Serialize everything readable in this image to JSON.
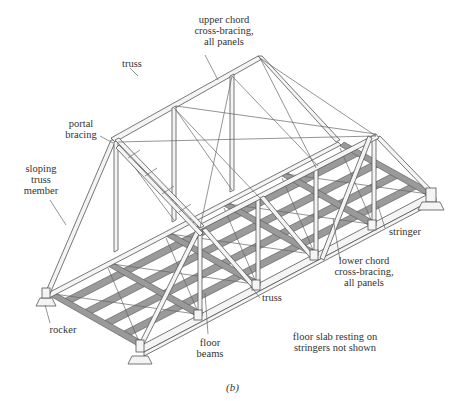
{
  "figure": {
    "caption": "(b)",
    "labels": {
      "upper_chord": "upper chord\ncross-bracing,\nall panels",
      "truss_top": "truss",
      "portal_bracing": "portal\nbracing",
      "sloping_member": "sloping\ntruss\nmember",
      "stringer": "stringer",
      "lower_chord": "lower chord\ncross-bracing,\nall panels",
      "truss_bottom": "truss",
      "rocker": "rocker",
      "floor_beams": "floor\nbeams",
      "floor_slab_note": "floor slab resting on\nstringers not shown"
    },
    "colors": {
      "background": "#ffffff",
      "line": "#555555",
      "steel_shade": "#9a9a9a",
      "text": "#333333"
    }
  }
}
